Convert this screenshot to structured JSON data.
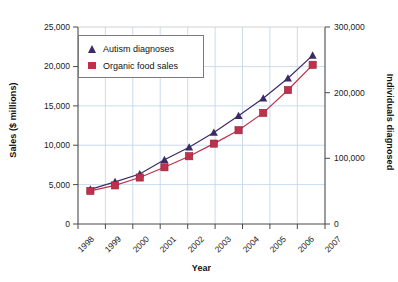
{
  "chart_data": {
    "type": "line",
    "title": "",
    "subtitle": "",
    "xlabel": "Year",
    "ylabel": "Sales ($ millions)",
    "ylabel_right": "Individuals diagnosed",
    "categories": [
      "1998",
      "1999",
      "2000",
      "2001",
      "2002",
      "2003",
      "2004",
      "2005",
      "2006",
      "2007"
    ],
    "x": [
      1998,
      1999,
      2000,
      2001,
      2002,
      2003,
      2004,
      2005,
      2006,
      2007
    ],
    "ylim": [
      0,
      25000
    ],
    "ylim_right": [
      0,
      300000
    ],
    "yticks": [
      "0",
      "5,000",
      "10,000",
      "15,000",
      "20,000",
      "25,000"
    ],
    "ytick_values": [
      0,
      5000,
      10000,
      15000,
      20000,
      25000
    ],
    "yticks_right": [
      "0",
      "100,000",
      "200,000",
      "300,000"
    ],
    "ytick_values_right": [
      0,
      100000,
      200000,
      300000
    ],
    "grid": true,
    "legend_position": "top-left",
    "series": [
      {
        "name": "Autism diagnoses",
        "axis": "right",
        "marker": "triangle",
        "color": "#3b2a66",
        "values": [
          53000,
          64000,
          76000,
          98000,
          117000,
          139000,
          165000,
          191000,
          222000,
          257000
        ],
        "values_left_scale": [
          4400,
          5350,
          6350,
          8150,
          9750,
          11600,
          13750,
          15950,
          18500,
          21400
        ]
      },
      {
        "name": "Organic food sales",
        "axis": "left",
        "marker": "square",
        "color": "#c0304a",
        "values": [
          4200,
          4900,
          5900,
          7200,
          8600,
          10200,
          11900,
          14100,
          17000,
          20200
        ]
      }
    ]
  },
  "legend": {
    "items": [
      {
        "label": "Autism diagnoses",
        "marker": "triangle-marker",
        "color": "#3b2a66"
      },
      {
        "label": "Organic food sales",
        "marker": "square-marker",
        "color": "#c0304a"
      }
    ]
  },
  "axes": {
    "left_title": "Sales ($ millions)",
    "right_title": "Individuals diagnosed",
    "bottom_title": "Year"
  }
}
